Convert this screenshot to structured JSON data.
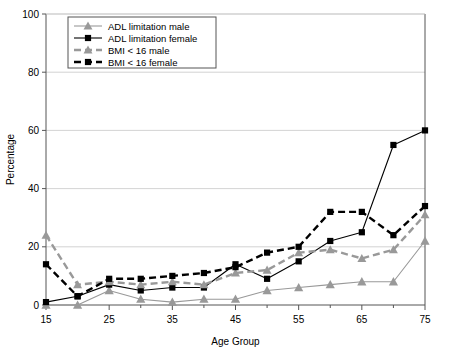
{
  "chart_data": {
    "type": "line",
    "title": "",
    "subtitle": "",
    "xlabel": "Age Group",
    "ylabel": "Percentage",
    "xlim": [
      15,
      75
    ],
    "ylim": [
      0,
      100
    ],
    "xticks": [
      15,
      25,
      35,
      45,
      55,
      65,
      75
    ],
    "xticklabels": [
      "15",
      "25",
      "35",
      "45",
      "55",
      "65",
      "75"
    ],
    "xminorticks": [
      20,
      30,
      40,
      50,
      60,
      70
    ],
    "yticks": [
      0,
      20,
      40,
      60,
      80,
      100
    ],
    "yticklabels": [
      "0",
      "20",
      "40",
      "60",
      "80",
      "100"
    ],
    "grid": "horizontal",
    "legend_position": "upper-left",
    "x": [
      15,
      20,
      25,
      30,
      35,
      40,
      45,
      50,
      55,
      60,
      65,
      70,
      75
    ],
    "series": [
      {
        "name": "ADL limitation male",
        "marker": "triangle",
        "color": "#999999",
        "linestyle": "solid",
        "values": [
          0,
          0,
          5,
          2,
          1,
          2,
          2,
          5,
          6,
          7,
          8,
          8,
          22
        ]
      },
      {
        "name": "ADL limitation female",
        "marker": "square",
        "color": "#000000",
        "linestyle": "solid",
        "values": [
          1,
          3,
          7,
          5,
          6,
          6,
          14,
          9,
          15,
          22,
          25,
          55,
          60
        ]
      },
      {
        "name": "BMI < 16 male",
        "marker": "triangle",
        "color": "#999999",
        "linestyle": "dashed",
        "values": [
          24,
          7,
          8,
          7,
          8,
          7,
          11,
          12,
          18,
          19,
          16,
          19,
          31
        ]
      },
      {
        "name": "BMI < 16 female",
        "marker": "square",
        "color": "#000000",
        "linestyle": "dashed",
        "values": [
          14,
          3,
          9,
          9,
          10,
          11,
          13,
          18,
          20,
          32,
          32,
          24,
          34
        ]
      }
    ]
  },
  "legend": {
    "items": [
      {
        "label": "ADL limitation male"
      },
      {
        "label": "ADL limitation female"
      },
      {
        "label": "BMI < 16 male"
      },
      {
        "label": "BMI < 16 female"
      }
    ]
  },
  "colors": {
    "series_black": "#000000",
    "series_gray": "#999999",
    "gridline": "#c8c8c8",
    "axis": "#555555",
    "background": "#ffffff"
  }
}
